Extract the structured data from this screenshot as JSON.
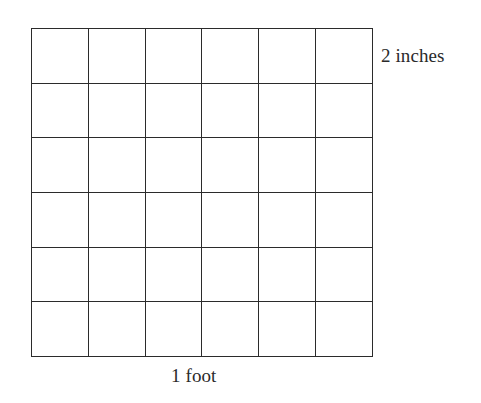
{
  "figure": {
    "name": "grid-square-diagram",
    "background_color": "#ffffff",
    "line_color": "#2b2b2b",
    "text_color": "#2a2a2a"
  },
  "labels": {
    "height_label": "2 inches",
    "width_label": "1 foot"
  },
  "chart_data": {
    "type": "table",
    "title": "",
    "xlabel": "1 foot",
    "ylabel": "2 inches",
    "rows": 6,
    "columns": 6,
    "total_cells": 36,
    "cell_width_label": "2 inches",
    "cell_height_label": "2 inches",
    "square_side_label": "1 foot",
    "annotations": [
      "2 inches",
      "1 foot"
    ],
    "grid": true,
    "legend": "none",
    "cells": [
      [
        "",
        "",
        "",
        "",
        "",
        ""
      ],
      [
        "",
        "",
        "",
        "",
        "",
        ""
      ],
      [
        "",
        "",
        "",
        "",
        "",
        ""
      ],
      [
        "",
        "",
        "",
        "",
        "",
        ""
      ],
      [
        "",
        "",
        "",
        "",
        "",
        ""
      ],
      [
        "",
        "",
        "",
        "",
        "",
        ""
      ]
    ]
  }
}
